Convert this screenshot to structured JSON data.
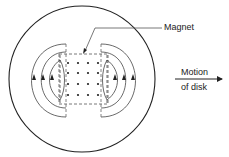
{
  "figure": {
    "labels": {
      "magnet": "Magnet",
      "motion_line1": "Motion",
      "motion_line2": "of disk"
    },
    "colors": {
      "stroke": "#333333",
      "background": "#ffffff"
    },
    "elements": {
      "disk": "circle",
      "magnet": "dashed-rectangle",
      "field_dots_columns": 4,
      "field_dots_rows": 4,
      "eddy_current_loops_per_side": 3,
      "motion_direction": "right"
    }
  }
}
